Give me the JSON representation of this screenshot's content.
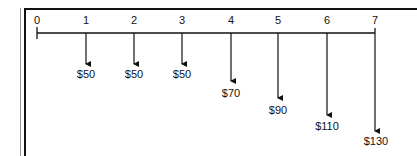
{
  "diagram": {
    "type": "cash-flow-timeline",
    "periods": [
      "0",
      "1",
      "2",
      "3",
      "4",
      "5",
      "6",
      "7"
    ],
    "cash_flows": [
      {
        "period": "1",
        "label": "$50",
        "value": 50
      },
      {
        "period": "2",
        "label": "$50",
        "value": 50
      },
      {
        "period": "3",
        "label": "$50",
        "value": 50
      },
      {
        "period": "4",
        "label": "$70",
        "value": 70
      },
      {
        "period": "5",
        "label": "$90",
        "value": 90
      },
      {
        "period": "6",
        "label": "$110",
        "value": 110
      },
      {
        "period": "7",
        "label": "$130",
        "value": 130
      }
    ],
    "direction": "outflow",
    "line_color": "#111111"
  }
}
